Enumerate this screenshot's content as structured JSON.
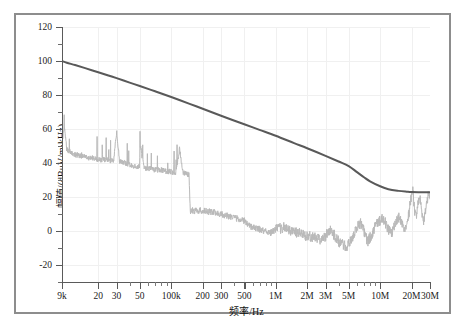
{
  "chart_data": {
    "type": "line",
    "title": "",
    "xlabel": "频率/Hz",
    "ylabel": "幅值/(dBμV/m·kHz)",
    "xscale": "log",
    "yscale": "linear",
    "xlim": [
      9000,
      30000000
    ],
    "ylim": [
      -30,
      120
    ],
    "grid": true,
    "legend": "none",
    "y_ticks_major": [
      120,
      100,
      80,
      60,
      40,
      20,
      0,
      -20
    ],
    "y_ticks_minor": [
      110,
      90,
      70,
      50,
      30,
      10,
      -10,
      -30
    ],
    "y_tick_labels": [
      "120",
      "100",
      "80",
      "60",
      "40",
      "20",
      "0",
      "-20"
    ],
    "x_ticks": [
      {
        "value": 9000,
        "label": "9k"
      },
      {
        "value": 20000,
        "label": "20"
      },
      {
        "value": 30000,
        "label": "30"
      },
      {
        "value": 50000,
        "label": "50"
      },
      {
        "value": 100000,
        "label": "100k"
      },
      {
        "value": 200000,
        "label": "200"
      },
      {
        "value": 300000,
        "label": "300"
      },
      {
        "value": 500000,
        "label": "500"
      },
      {
        "value": 1000000,
        "label": "1M"
      },
      {
        "value": 2000000,
        "label": "2M"
      },
      {
        "value": 3000000,
        "label": "3M"
      },
      {
        "value": 5000000,
        "label": "5M"
      },
      {
        "value": 10000000,
        "label": "10M"
      },
      {
        "value": 20000000,
        "label": "20M"
      },
      {
        "value": 30000000,
        "label": "30M"
      }
    ],
    "x_minor_ticks": [
      40000,
      60000,
      70000,
      80000,
      90000,
      400000,
      600000,
      700000,
      800000,
      900000,
      4000000,
      6000000,
      7000000,
      8000000,
      9000000
    ],
    "series": [
      {
        "name": "limit-line",
        "color": "#595959",
        "width": 2.0,
        "points": [
          [
            9000,
            100.0
          ],
          [
            10000,
            99.0
          ],
          [
            12000,
            97.6
          ],
          [
            15000,
            95.8
          ],
          [
            20000,
            93.4
          ],
          [
            25000,
            91.5
          ],
          [
            30000,
            89.9
          ],
          [
            40000,
            87.3
          ],
          [
            50000,
            85.3
          ],
          [
            70000,
            82.2
          ],
          [
            100000,
            78.8
          ],
          [
            150000,
            74.8
          ],
          [
            200000,
            71.9
          ],
          [
            300000,
            67.8
          ],
          [
            500000,
            62.8
          ],
          [
            700000,
            59.5
          ],
          [
            1000000,
            56.0
          ],
          [
            1500000,
            51.7
          ],
          [
            2000000,
            48.7
          ],
          [
            3000000,
            44.2
          ],
          [
            4000000,
            40.9
          ],
          [
            5000000,
            38.2
          ],
          [
            6000000,
            34.6
          ],
          [
            7000000,
            31.6
          ],
          [
            8000000,
            29.2
          ],
          [
            10000000,
            26.3
          ],
          [
            12000000,
            24.6
          ],
          [
            15000000,
            23.6
          ],
          [
            18000000,
            23.1
          ],
          [
            20000000,
            22.9
          ],
          [
            25000000,
            22.8
          ],
          [
            30000000,
            22.8
          ]
        ]
      },
      {
        "name": "measured-emission",
        "color": "#b9b9b9",
        "width": 1.0,
        "description": "noisy measured emission trace with narrowband spikes, step drop near 150 kHz, rising lobes above 3 MHz exceeding the limit near 20 MHz",
        "envelope": [
          [
            9000,
            52
          ],
          [
            9500,
            60
          ],
          [
            10000,
            48
          ],
          [
            11000,
            46
          ],
          [
            12000,
            45
          ],
          [
            14000,
            44
          ],
          [
            16000,
            43
          ],
          [
            18000,
            43
          ],
          [
            20000,
            42
          ],
          [
            24000,
            42
          ],
          [
            28000,
            41
          ],
          [
            30000,
            58
          ],
          [
            32000,
            41
          ],
          [
            36000,
            40
          ],
          [
            40000,
            39
          ],
          [
            45000,
            38
          ],
          [
            50000,
            38
          ],
          [
            50000,
            52
          ],
          [
            55000,
            37
          ],
          [
            60000,
            37
          ],
          [
            70000,
            36
          ],
          [
            80000,
            36
          ],
          [
            90000,
            35
          ],
          [
            100000,
            35
          ],
          [
            110000,
            34
          ],
          [
            120000,
            48
          ],
          [
            130000,
            34
          ],
          [
            140000,
            34
          ],
          [
            148000,
            33
          ],
          [
            152000,
            12
          ],
          [
            160000,
            12
          ],
          [
            180000,
            12
          ],
          [
            200000,
            12
          ],
          [
            250000,
            11
          ],
          [
            300000,
            10
          ],
          [
            400000,
            8
          ],
          [
            500000,
            6
          ],
          [
            600000,
            2
          ],
          [
            700000,
            1
          ],
          [
            800000,
            0
          ],
          [
            900000,
            -1
          ],
          [
            1000000,
            1
          ],
          [
            1200000,
            2
          ],
          [
            1400000,
            0
          ],
          [
            1600000,
            -1
          ],
          [
            1800000,
            -2
          ],
          [
            2000000,
            -3
          ],
          [
            2400000,
            -4
          ],
          [
            2800000,
            -5
          ],
          [
            3000000,
            -3
          ],
          [
            3300000,
            1
          ],
          [
            3600000,
            -2
          ],
          [
            4000000,
            -6
          ],
          [
            4400000,
            -8
          ],
          [
            4800000,
            -10
          ],
          [
            5000000,
            -8
          ],
          [
            5500000,
            -3
          ],
          [
            6000000,
            2
          ],
          [
            6400000,
            5
          ],
          [
            6800000,
            2
          ],
          [
            7200000,
            -3
          ],
          [
            7600000,
            -6
          ],
          [
            8000000,
            -4
          ],
          [
            8600000,
            0
          ],
          [
            9200000,
            4
          ],
          [
            10000000,
            6
          ],
          [
            10600000,
            8
          ],
          [
            11200000,
            5
          ],
          [
            12000000,
            1
          ],
          [
            12800000,
            -2
          ],
          [
            13600000,
            2
          ],
          [
            14400000,
            6
          ],
          [
            15000000,
            8
          ],
          [
            15800000,
            6
          ],
          [
            16600000,
            2
          ],
          [
            17400000,
            0
          ],
          [
            18000000,
            4
          ],
          [
            19000000,
            12
          ],
          [
            20000000,
            22
          ],
          [
            20600000,
            24
          ],
          [
            21200000,
            14
          ],
          [
            22000000,
            8
          ],
          [
            23000000,
            16
          ],
          [
            24000000,
            20
          ],
          [
            25000000,
            12
          ],
          [
            26000000,
            6
          ],
          [
            27000000,
            10
          ],
          [
            28000000,
            18
          ],
          [
            29000000,
            22
          ],
          [
            30000000,
            20
          ]
        ]
      }
    ]
  },
  "axes": {
    "frame_color": "#8d8d8d",
    "axis_color": "#5a5a5a",
    "grid_color": "#f0f0f0",
    "text_color": "#111111"
  }
}
